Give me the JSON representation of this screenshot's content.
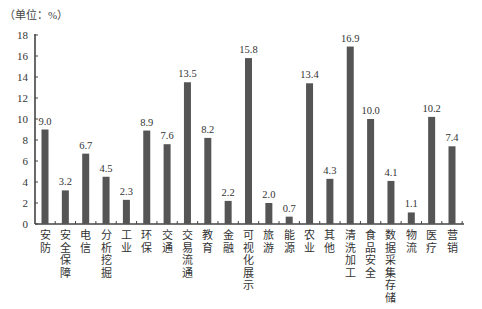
{
  "unit_label": "（单位：%）",
  "chart_data": {
    "type": "bar",
    "title": "",
    "xlabel": "",
    "ylabel": "（单位：%）",
    "ylim": [
      0,
      18
    ],
    "yticks": [
      0,
      2,
      4,
      6,
      8,
      10,
      12,
      14,
      16,
      18
    ],
    "grid": false,
    "legend": null,
    "bar_color": "#555555",
    "categories": [
      "安防",
      "安全保障",
      "电信",
      "分析挖掘",
      "工业",
      "环保",
      "交通",
      "交易流通",
      "教育",
      "金融",
      "可视化展示",
      "旅游",
      "能源",
      "农业",
      "其他",
      "清洗加工",
      "食品安全",
      "数据采集存储",
      "物流",
      "医疗",
      "营销"
    ],
    "values": [
      9.0,
      3.2,
      6.7,
      4.5,
      2.3,
      8.9,
      7.6,
      13.5,
      8.2,
      2.2,
      15.8,
      2.0,
      0.7,
      13.4,
      4.3,
      16.9,
      10.0,
      4.1,
      1.1,
      10.2,
      7.4
    ],
    "value_labels": [
      "9.0",
      "3.2",
      "6.7",
      "4.5",
      "2.3",
      "8.9",
      "7.6",
      "13.5",
      "8.2",
      "2.2",
      "15.8",
      "2.0",
      "0.7",
      "13.4",
      "4.3",
      "16.9",
      "10.0",
      "4.1",
      "1.1",
      "10.2",
      "7.4"
    ]
  }
}
